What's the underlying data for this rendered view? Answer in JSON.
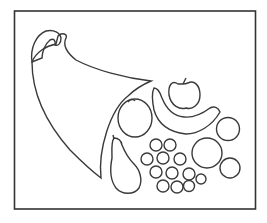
{
  "illustration": {
    "subject": "cornucopia with fruits",
    "colors": {
      "ink": "#3a3a3a",
      "background": "#ffffff"
    },
    "items": [
      "horn",
      "apple",
      "banana",
      "orange",
      "pear",
      "grapes",
      "round-fruit-large",
      "round-fruit-right-top",
      "round-fruit-right-bottom"
    ]
  }
}
